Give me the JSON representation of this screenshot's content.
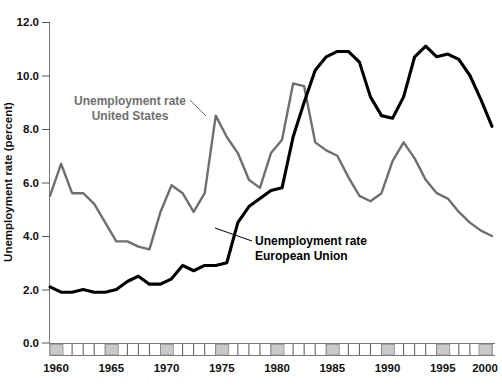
{
  "chart_data": {
    "type": "line",
    "title": "",
    "xlabel": "",
    "ylabel": "Unemployment rate (percent)",
    "xlim": [
      1960,
      2000
    ],
    "ylim": [
      0.0,
      12.0
    ],
    "yticks": [
      "0.0",
      "2.0",
      "4.0",
      "6.0",
      "8.0",
      "10.0",
      "12.0"
    ],
    "ytick_values": [
      0.0,
      2.0,
      4.0,
      6.0,
      8.0,
      10.0,
      12.0
    ],
    "xticks": [
      "1960",
      "1965",
      "1970",
      "1975",
      "1980",
      "1985",
      "1990",
      "1995",
      "2000"
    ],
    "xtick_values": [
      1960,
      1965,
      1970,
      1975,
      1980,
      1985,
      1990,
      1995,
      2000
    ],
    "grid": false,
    "legend_position": "inline-annotations",
    "x": [
      1960,
      1961,
      1962,
      1963,
      1964,
      1965,
      1966,
      1967,
      1968,
      1969,
      1970,
      1971,
      1972,
      1973,
      1974,
      1975,
      1976,
      1977,
      1978,
      1979,
      1980,
      1981,
      1982,
      1983,
      1984,
      1985,
      1986,
      1987,
      1988,
      1989,
      1990,
      1991,
      1992,
      1993,
      1994,
      1995,
      1996,
      1997,
      1998,
      1999,
      2000
    ],
    "series": [
      {
        "name": "Unemployment rate United States",
        "color": "#6f6f6f",
        "values": [
          5.5,
          6.7,
          5.6,
          5.6,
          5.2,
          4.5,
          3.8,
          3.8,
          3.6,
          3.5,
          4.9,
          5.9,
          5.6,
          4.9,
          5.6,
          8.5,
          7.7,
          7.1,
          6.1,
          5.8,
          7.1,
          7.6,
          9.7,
          9.6,
          7.5,
          7.2,
          7.0,
          6.2,
          5.5,
          5.3,
          5.6,
          6.8,
          7.5,
          6.9,
          6.1,
          5.6,
          5.4,
          4.9,
          4.5,
          4.2,
          4.0
        ]
      },
      {
        "name": "Unemployment rate European Union",
        "color": "#000000",
        "values": [
          2.1,
          1.9,
          1.9,
          2.0,
          1.9,
          1.9,
          2.0,
          2.3,
          2.5,
          2.2,
          2.2,
          2.4,
          2.9,
          2.7,
          2.9,
          2.9,
          3.0,
          4.5,
          5.1,
          5.4,
          5.7,
          5.8,
          7.7,
          9.0,
          10.2,
          10.7,
          10.9,
          10.9,
          10.5,
          9.2,
          8.5,
          8.4,
          9.2,
          10.7,
          11.1,
          10.7,
          10.8,
          10.6,
          10.0,
          9.1,
          8.1
        ]
      }
    ],
    "annotations": [
      {
        "id": "annotation-us",
        "line1": "Unemployment rate",
        "line2": "United States",
        "color": "#6f6f6f"
      },
      {
        "id": "annotation-eu",
        "line1": "Unemployment rate",
        "line2": "European Union",
        "color": "#000000"
      }
    ]
  }
}
